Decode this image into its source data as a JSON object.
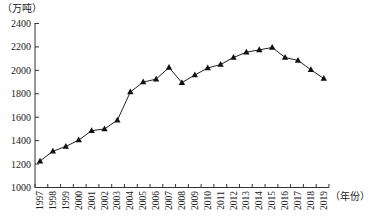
{
  "chart_data": {
    "type": "line",
    "title": "",
    "ylabel": "（万吨）",
    "xlabel": "（年份）",
    "ylim": [
      1000,
      2400
    ],
    "yticks": [
      1000,
      1200,
      1400,
      1600,
      1800,
      2000,
      2200,
      2400
    ],
    "grid": false,
    "legend": null,
    "marker": "triangle",
    "categories": [
      "1997",
      "1998",
      "1999",
      "2000",
      "2001",
      "2002",
      "2003",
      "2004",
      "2005",
      "2006",
      "2007",
      "2008",
      "2009",
      "2010",
      "2011",
      "2012",
      "2013",
      "2014",
      "2015",
      "2016",
      "2017",
      "2018",
      "2019"
    ],
    "series": [
      {
        "name": "",
        "values": [
          1225,
          1310,
          1350,
          1405,
          1485,
          1500,
          1575,
          1815,
          1900,
          1925,
          2025,
          1895,
          1960,
          2020,
          2050,
          2110,
          2155,
          2175,
          2195,
          2110,
          2085,
          2005,
          1930
        ]
      }
    ]
  },
  "colors": {
    "line": "#222222",
    "axis": "#333333"
  }
}
